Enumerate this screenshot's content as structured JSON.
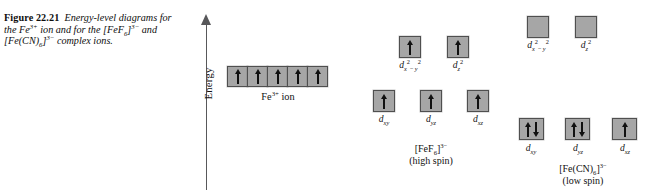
{
  "figure": {
    "label": "Figure 22.21",
    "caption_parts": [
      "Energy-level diagrams for the Fe",
      "3+",
      " ion and for the [FeF",
      "6",
      "]",
      "3−",
      " and [Fe(CN)",
      "6",
      "]",
      "3−",
      " complex ions."
    ],
    "caption_plain": "Energy-level diagrams for the Fe3+ ion and for the [FeF6]3− and [Fe(CN)6]3− complex ions."
  },
  "axis": {
    "label": "Energy",
    "arrow_direction": "up",
    "color": "#58585a"
  },
  "style": {
    "box_fill": "#a6a6a6",
    "box_border": "#4f4f4f",
    "arrow_color": "#111111",
    "text_color": "#111111",
    "background": "#ffffff"
  },
  "diagrams": [
    {
      "id": "free-ion",
      "caption_main": "Fe",
      "caption_sup": "3+",
      "caption_tail": " ion",
      "caption_plain": "Fe3+ ion",
      "spin_note": "",
      "rows": [
        {
          "id": "free-ion-d-row",
          "joined": true,
          "boxes": [
            {
              "label_plain": "",
              "electrons": [
                "up"
              ]
            },
            {
              "label_plain": "",
              "electrons": [
                "up"
              ]
            },
            {
              "label_plain": "",
              "electrons": [
                "up"
              ]
            },
            {
              "label_plain": "",
              "electrons": [
                "up"
              ]
            },
            {
              "label_plain": "",
              "electrons": [
                "up"
              ]
            }
          ]
        }
      ]
    },
    {
      "id": "fef6-high-spin",
      "caption_main": "[FeF",
      "caption_sub": "6",
      "caption_bracket": "]",
      "caption_sup": "3−",
      "caption_plain": "[FeF6]3−",
      "spin_note": "(high spin)",
      "rows": [
        {
          "id": "fef6-eg",
          "joined": false,
          "boxes": [
            {
              "label_base": "d",
              "label_sub": "x",
              "label_sup1": "2",
              "label_mid": "− y",
              "label_sup2": "2",
              "label_plain": "dx2−y2",
              "electrons": [
                "up"
              ]
            },
            {
              "label_base": "d",
              "label_sub": "z",
              "label_sup1": "2",
              "label_plain": "dz2",
              "electrons": [
                "up"
              ]
            }
          ]
        },
        {
          "id": "fef6-t2g",
          "joined": false,
          "boxes": [
            {
              "label_base": "d",
              "label_sub": "xy",
              "label_plain": "dxy",
              "electrons": [
                "up"
              ]
            },
            {
              "label_base": "d",
              "label_sub": "yz",
              "label_plain": "dyz",
              "electrons": [
                "up"
              ]
            },
            {
              "label_base": "d",
              "label_sub": "xz",
              "label_plain": "dxz",
              "electrons": [
                "up"
              ]
            }
          ]
        }
      ]
    },
    {
      "id": "fecn6-low-spin",
      "caption_main": "[Fe(CN)",
      "caption_sub": "6",
      "caption_bracket": "]",
      "caption_sup": "3−",
      "caption_plain": "[Fe(CN)6]3−",
      "spin_note": "(low spin)",
      "rows": [
        {
          "id": "fecn6-eg",
          "joined": false,
          "boxes": [
            {
              "label_base": "d",
              "label_sub": "x",
              "label_sup1": "2",
              "label_mid": "− y",
              "label_sup2": "2",
              "label_plain": "dx2−y2",
              "electrons": []
            },
            {
              "label_base": "d",
              "label_sub": "z",
              "label_sup1": "2",
              "label_plain": "dz2",
              "electrons": []
            }
          ]
        },
        {
          "id": "fecn6-t2g",
          "joined": false,
          "boxes": [
            {
              "label_base": "d",
              "label_sub": "xy",
              "label_plain": "dxy",
              "electrons": [
                "up",
                "down"
              ]
            },
            {
              "label_base": "d",
              "label_sub": "yz",
              "label_plain": "dyz",
              "electrons": [
                "up",
                "down"
              ]
            },
            {
              "label_base": "d",
              "label_sub": "xz",
              "label_plain": "dxz",
              "electrons": [
                "up"
              ]
            }
          ]
        }
      ]
    }
  ]
}
